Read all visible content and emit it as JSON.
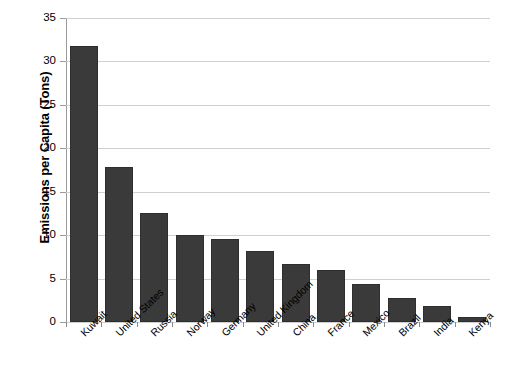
{
  "chart_data": {
    "type": "bar",
    "title": "",
    "subtitle": "",
    "xlabel": "",
    "ylabel": "Emissions per Capita (Tons)",
    "categories": [
      "Kuwait",
      "United States",
      "Russia",
      "Norway",
      "Germany",
      "United Kingdom",
      "China",
      "France",
      "Mexico",
      "Brazil",
      "India",
      "Kenya"
    ],
    "values": [
      31.8,
      17.8,
      12.6,
      10.0,
      9.5,
      8.2,
      6.7,
      6.0,
      4.4,
      2.8,
      1.8,
      0.6
    ],
    "ylim": [
      0,
      35
    ],
    "ytick_values": [
      0,
      5,
      10,
      15,
      20,
      25,
      30,
      35
    ],
    "ytick_labels": [
      "0",
      "5",
      "10",
      "15",
      "20",
      "25",
      "30",
      "35"
    ],
    "grid": true,
    "grid_axis": "y",
    "legend": false,
    "legend_position": "none",
    "bar_color": "#3a3a3a",
    "grid_color": "#d0d0d0",
    "axis_color": "#6b6b6b",
    "background_color": "#ffffff",
    "xlabel_rotation": -45
  }
}
